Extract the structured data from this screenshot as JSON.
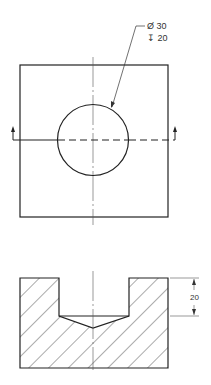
{
  "drawing": {
    "top_view": {
      "callout": {
        "diameter_label": "Ø 30",
        "depth_label": "↧ 20"
      }
    },
    "section_view": {
      "depth_dimension": "20"
    },
    "colors": {
      "outline": "#222222",
      "centerline": "#555555",
      "hatch": "#444444"
    }
  }
}
